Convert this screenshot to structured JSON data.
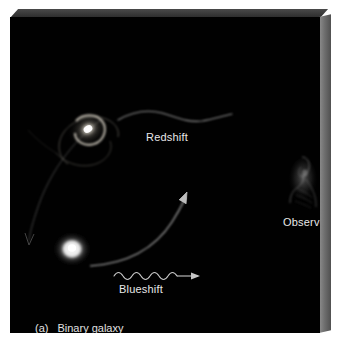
{
  "figure": {
    "caption_tag": "(a)",
    "caption_text": "Binary galaxy",
    "panel_background": "#010101",
    "page_background": "#ffffff",
    "slab_edge_color": "#6f6f6f",
    "label_color": "#e8e8e8"
  },
  "labels": {
    "redshift": "Redshift",
    "blueshift": "Blueshift",
    "observer": "Observer"
  },
  "objects": {
    "spiral_galaxy": {
      "name": "spiral-galaxy",
      "cx": 78,
      "cy": 111,
      "core_color": "#fdfdfd"
    },
    "elliptical_galaxy": {
      "name": "elliptical-galaxy",
      "cx": 62,
      "cy": 231,
      "core_color": "#fbfbfb"
    },
    "observer_figure": {
      "name": "observer-silhouette",
      "cx": 294,
      "cy": 162,
      "color": "#3c3c3c"
    }
  },
  "waves": {
    "redshift_wave": {
      "description": "long-wavelength wave emitted toward observer",
      "humps": 2,
      "x_start": 108,
      "x_end": 222,
      "y": 101,
      "color": "#bdbdbd"
    },
    "blueshift_wave": {
      "description": "short-wavelength wave with arrowhead toward observer",
      "humps": 5,
      "x_start": 104,
      "x_end": 188,
      "y": 257,
      "color": "#cfcfcf"
    }
  },
  "orbit_arrows": {
    "upper_arrow": {
      "name": "orbit-arrow-receding",
      "direction": "down-left",
      "color": "#6e6e6e"
    },
    "lower_arrow": {
      "name": "orbit-arrow-approaching",
      "direction": "up-right",
      "color": "#d2d2d2"
    }
  }
}
